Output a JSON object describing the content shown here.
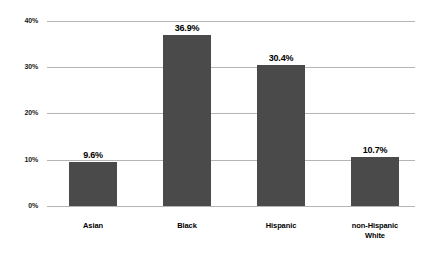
{
  "chart_data": {
    "type": "bar",
    "title": "",
    "subtitle": "",
    "xlabel": "",
    "ylabel": "",
    "categories": [
      "Asian",
      "Black",
      "Hispanic",
      "non-Hispanic White"
    ],
    "category_lines": [
      [
        "Asian"
      ],
      [
        "Black"
      ],
      [
        "Hispanic"
      ],
      [
        "non-Hispanic",
        "White"
      ]
    ],
    "values": [
      9.6,
      36.9,
      30.4,
      10.7
    ],
    "value_labels": [
      "9.6%",
      "36.9%",
      "30.4%",
      "10.7%"
    ],
    "ylim": [
      0,
      40
    ],
    "y_ticks": [
      0,
      10,
      20,
      30,
      40
    ],
    "y_tick_labels": [
      "0%",
      "10%",
      "20%",
      "30%",
      "40%"
    ],
    "grid": "horizontal",
    "legend": "none",
    "bar_color": "#4a4a4a",
    "gridline_color": "#b4b4b4",
    "background_color": "#ffffff",
    "text_color": "#000000"
  }
}
